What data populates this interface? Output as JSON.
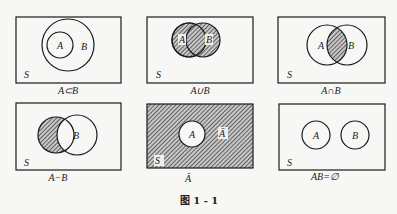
{
  "figure": {
    "caption": "图 1 - 1",
    "panels": [
      {
        "id": "subset",
        "caption": "A⊂B",
        "universe_label": "S",
        "labels": [
          "A",
          "B"
        ],
        "shaded": "none"
      },
      {
        "id": "union",
        "caption": "A∪B",
        "universe_label": "S",
        "labels": [
          "A",
          "B"
        ],
        "shaded": "A and B"
      },
      {
        "id": "intersection",
        "caption": "A∩B",
        "universe_label": "S",
        "labels": [
          "A",
          "B"
        ],
        "shaded": "overlap"
      },
      {
        "id": "difference",
        "caption": "A−B",
        "universe_label": "S",
        "labels": [
          "B"
        ],
        "shaded": "A minus B"
      },
      {
        "id": "complement",
        "caption": "Ā",
        "universe_label": "S",
        "labels": [
          "A",
          "Ā"
        ],
        "shaded": "outside A"
      },
      {
        "id": "disjoint",
        "caption": "AB=∅",
        "universe_label": "S",
        "labels": [
          "A",
          "B"
        ],
        "shaded": "none"
      }
    ]
  },
  "colors": {
    "stroke": "#1a1a1a",
    "hatch": "#333333",
    "background": "#f7f7f5"
  }
}
